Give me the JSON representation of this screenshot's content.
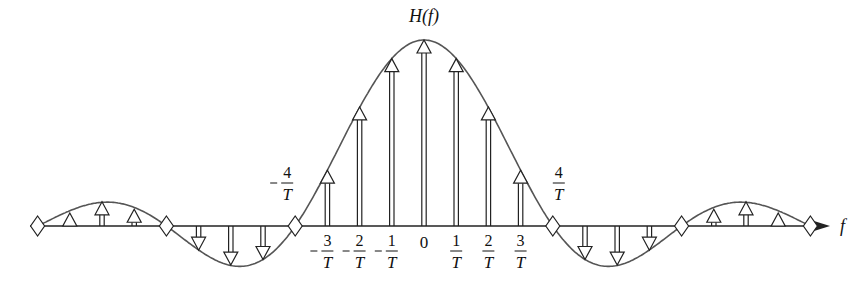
{
  "figure": {
    "title": "H(f)",
    "axis_label": "f",
    "colors": {
      "curve": "#555555",
      "axis": "#222222",
      "arrow_fill": "#ffffff",
      "arrow_stroke": "#222222",
      "text": "#111111"
    },
    "tick_labels": [
      {
        "k": -4,
        "num": "4",
        "den": "T",
        "sign": "−",
        "pos": "above"
      },
      {
        "k": -3,
        "num": "3",
        "den": "T",
        "sign": "−",
        "pos": "below"
      },
      {
        "k": -2,
        "num": "2",
        "den": "T",
        "sign": "−",
        "pos": "below"
      },
      {
        "k": -1,
        "num": "1",
        "den": "T",
        "sign": "−",
        "pos": "below"
      },
      {
        "k": 0,
        "num": "0",
        "den": "",
        "sign": "",
        "pos": "below"
      },
      {
        "k": 1,
        "num": "1",
        "den": "T",
        "sign": "",
        "pos": "below"
      },
      {
        "k": 2,
        "num": "2",
        "den": "T",
        "sign": "",
        "pos": "below"
      },
      {
        "k": 3,
        "num": "3",
        "den": "T",
        "sign": "",
        "pos": "below"
      },
      {
        "k": 4,
        "num": "4",
        "den": "T",
        "sign": "",
        "pos": "above"
      }
    ],
    "geometry": {
      "origin_x": 424,
      "axis_y": 226,
      "unit_px": 32.2,
      "peak_px": 186,
      "zero_spacing_k": 4,
      "axis_x_start": 30,
      "axis_x_end": 830
    }
  },
  "chart_data": {
    "type": "stem",
    "title": "H(f)",
    "xlabel": "f",
    "ylabel": "",
    "x_unit": "1/T",
    "envelope": "sinc(f*T/4)",
    "zeros_k": [
      -12,
      -8,
      -4,
      4,
      8,
      12
    ],
    "impulses": [
      {
        "k": -11,
        "value": 0.07
      },
      {
        "k": -10,
        "value": 0.13
      },
      {
        "k": -9,
        "value": 0.09
      },
      {
        "k": -7,
        "value": -0.13
      },
      {
        "k": -6,
        "value": -0.21
      },
      {
        "k": -5,
        "value": -0.18
      },
      {
        "k": -3,
        "value": 0.3
      },
      {
        "k": -2,
        "value": 0.64
      },
      {
        "k": -1,
        "value": 0.9
      },
      {
        "k": 0,
        "value": 1.0
      },
      {
        "k": 1,
        "value": 0.9
      },
      {
        "k": 2,
        "value": 0.64
      },
      {
        "k": 3,
        "value": 0.3
      },
      {
        "k": 5,
        "value": -0.18
      },
      {
        "k": 6,
        "value": -0.21
      },
      {
        "k": 7,
        "value": -0.13
      },
      {
        "k": 9,
        "value": 0.09
      },
      {
        "k": 10,
        "value": 0.13
      },
      {
        "k": 11,
        "value": 0.07
      }
    ],
    "grid": false,
    "legend": null
  }
}
